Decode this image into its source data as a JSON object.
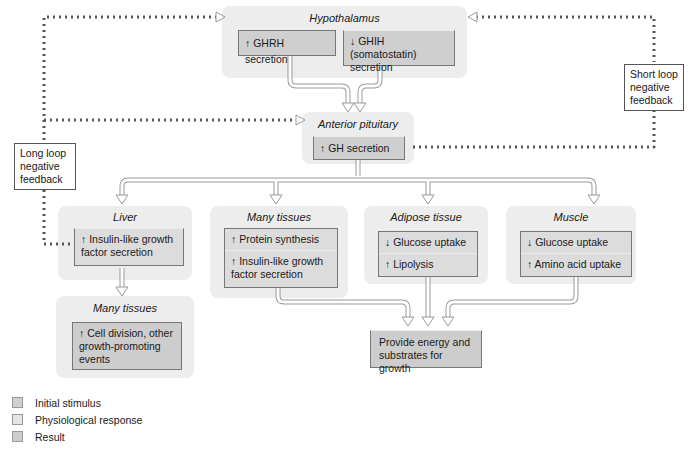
{
  "diagram": {
    "hypothalamus": {
      "title": "Hypothalamus",
      "items": [
        "↑ GHRH secretion",
        "↓ GHIH (somatostatin) secretion"
      ]
    },
    "anterior_pituitary": {
      "title": "Anterior pituitary",
      "items": [
        "↑ GH secretion"
      ]
    },
    "liver": {
      "title": "Liver",
      "items": [
        "↑ Insulin-like growth factor secretion"
      ]
    },
    "many_tissues_1": {
      "title": "Many tissues",
      "items": [
        "↑ Protein synthesis",
        "↑ Insulin-like growth factor secretion"
      ]
    },
    "adipose": {
      "title": "Adipose tissue",
      "items": [
        "↓ Glucose uptake",
        "↑ Lipolysis"
      ]
    },
    "muscle": {
      "title": "Muscle",
      "items": [
        "↓ Glucose uptake",
        "↑ Amino acid uptake"
      ]
    },
    "many_tissues_2": {
      "title": "Many tissues",
      "items": [
        "↑ Cell division, other growth-promoting events"
      ]
    },
    "result": {
      "text": "Provide energy and substrates for growth"
    },
    "feedback": {
      "long_loop": "Long loop negative feedback",
      "short_loop": "Short loop negative feedback"
    }
  },
  "legend": {
    "items": [
      {
        "label": "Initial stimulus",
        "color": "#cfcfcf"
      },
      {
        "label": "Physiological response",
        "color": "#e4e4e4"
      },
      {
        "label": "Result",
        "color": "#cdcdcd"
      }
    ]
  }
}
